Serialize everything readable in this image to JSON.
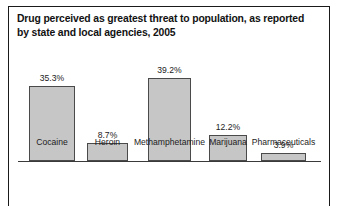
{
  "figure": {
    "title_line_1": "Drug perceived as greatest threat to population, as reported",
    "title_line_2": "by state and local agencies, 2005"
  },
  "chart_data": {
    "type": "bar",
    "title": "Drug perceived as greatest threat to population, as reported by state and local agencies, 2005",
    "xlabel": "",
    "ylabel": "",
    "ylim": [
      0,
      42
    ],
    "grid": false,
    "legend": "none",
    "value_suffix": "%",
    "categories": [
      "Cocaine",
      "Heroin",
      "Methamphetamine",
      "Marijuana",
      "Pharmaceuticals"
    ],
    "values": [
      35.3,
      8.7,
      39.2,
      12.2,
      3.9
    ],
    "value_labels": [
      "35.3%",
      "8.7%",
      "39.2%",
      "12.2%",
      "3.9%"
    ],
    "colors": {
      "bar_fill": "#c6c6c6",
      "bar_edge": "#4a4a4a",
      "axis": "#3a3a3a",
      "text": "#1c1c1c",
      "frame": "#1a1a1a",
      "background": "#ffffff"
    },
    "bars": [
      {
        "label": "Cocaine",
        "value": 35.3,
        "value_label": "35.3%",
        "left": 11,
        "width": 46
      },
      {
        "label": "Heroin",
        "value": 8.7,
        "value_label": "8.7%",
        "left": 69,
        "width": 41
      },
      {
        "label": "Methamphetamine",
        "value": 39.2,
        "value_label": "39.2%",
        "left": 130,
        "width": 43
      },
      {
        "label": "Marijuana",
        "value": 12.2,
        "value_label": "12.2%",
        "left": 191,
        "width": 38
      },
      {
        "label": "Pharmaceuticals",
        "value": 3.9,
        "value_label": "3.9%",
        "left": 243,
        "width": 45
      }
    ]
  }
}
